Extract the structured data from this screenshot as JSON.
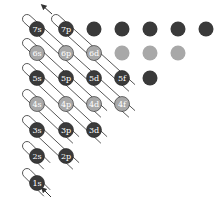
{
  "diagram": {
    "colors": {
      "dark": "#3a3a3a",
      "light": "#a8a8a8",
      "line": "#444444",
      "label": "#ffffff"
    },
    "columns_x": [
      37,
      66,
      94,
      122,
      150,
      178,
      206
    ],
    "rows": [
      {
        "n": 7,
        "y": 29,
        "shade": "dark",
        "orbitals": [
          {
            "label": "7s",
            "col": 0
          },
          {
            "label": "7p",
            "col": 1
          }
        ],
        "unlabeled_cols": [
          2,
          3,
          4,
          5,
          6
        ]
      },
      {
        "n": 6,
        "y": 53,
        "shade": "light",
        "orbitals": [
          {
            "label": "6s",
            "col": 0
          },
          {
            "label": "6p",
            "col": 1
          },
          {
            "label": "6d",
            "col": 2
          }
        ],
        "unlabeled_cols": [
          3,
          4,
          5
        ]
      },
      {
        "n": 5,
        "y": 78,
        "shade": "dark",
        "orbitals": [
          {
            "label": "5s",
            "col": 0
          },
          {
            "label": "5p",
            "col": 1
          },
          {
            "label": "5d",
            "col": 2
          },
          {
            "label": "5f",
            "col": 3
          }
        ],
        "unlabeled_cols": [
          4
        ]
      },
      {
        "n": 4,
        "y": 104,
        "shade": "light",
        "orbitals": [
          {
            "label": "4s",
            "col": 0
          },
          {
            "label": "4p",
            "col": 1
          },
          {
            "label": "4d",
            "col": 2
          },
          {
            "label": "4f",
            "col": 3
          }
        ],
        "unlabeled_cols": []
      },
      {
        "n": 3,
        "y": 130,
        "shade": "dark",
        "orbitals": [
          {
            "label": "3s",
            "col": 0
          },
          {
            "label": "3p",
            "col": 1
          },
          {
            "label": "3d",
            "col": 2
          }
        ],
        "unlabeled_cols": []
      },
      {
        "n": 2,
        "y": 156,
        "shade": "dark",
        "orbitals": [
          {
            "label": "2s",
            "col": 0
          },
          {
            "label": "2p",
            "col": 1
          }
        ],
        "unlabeled_cols": []
      },
      {
        "n": 1,
        "y": 183,
        "shade": "dark",
        "orbitals": [
          {
            "label": "1s",
            "col": 0
          }
        ],
        "unlabeled_cols": []
      }
    ],
    "filling_order": [
      "1s",
      "2s",
      "2p",
      "3s",
      "3p",
      "4s",
      "3d",
      "4p",
      "5s",
      "4d",
      "5p",
      "6s",
      "4f",
      "5d",
      "6p",
      "7s",
      "5f",
      "6d",
      "7p"
    ],
    "arrows": {
      "start": "bottom (1s), arrow entering from lower right",
      "end": "top left above 7p, arrow pointing up-left"
    }
  }
}
